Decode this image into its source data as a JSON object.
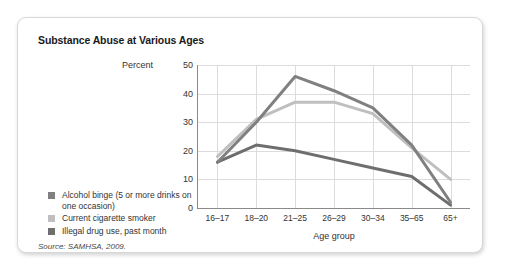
{
  "card": {
    "title": "Substance Abuse at Various Ages",
    "source_note": "Source: SAMHSA, 2009."
  },
  "colors": {
    "alcohol_binge": "#808080",
    "cigarette_smoker": "#bfbfbf",
    "illegal_drug": "#6e6e6e",
    "axis": "#8a8a8a",
    "grid": "#dcdcdc",
    "card_border": "#d8d8d8",
    "text": "#333333"
  },
  "legend": {
    "items": [
      {
        "label": "Alcohol binge (5 or more drinks on one occasion)",
        "color": "#808080"
      },
      {
        "label": "Current cigarette smoker",
        "color": "#bfbfbf"
      },
      {
        "label": "Illegal drug use, past month",
        "color": "#6e6e6e"
      }
    ]
  },
  "chart_data": {
    "type": "line",
    "title": "Substance Abuse at Various Ages",
    "subtitle": "",
    "xlabel": "Age group",
    "ylabel": "Percent",
    "categories": [
      "16–17",
      "18–20",
      "21–25",
      "26–29",
      "30–34",
      "35–65",
      "65+"
    ],
    "yticks": [
      0,
      10,
      20,
      30,
      40,
      50
    ],
    "ylim": [
      0,
      50
    ],
    "grid": true,
    "legend_position": "bottom-left-outside",
    "series": [
      {
        "name": "Alcohol binge (5 or more drinks on one occasion)",
        "color": "#808080",
        "values": [
          16,
          30,
          46,
          41,
          35,
          22,
          2
        ]
      },
      {
        "name": "Current cigarette smoker",
        "color": "#bfbfbf",
        "values": [
          18,
          31,
          37,
          37,
          33,
          21,
          10
        ]
      },
      {
        "name": "Illegal drug use, past month",
        "color": "#6e6e6e",
        "values": [
          16,
          22,
          20,
          17,
          14,
          11,
          1
        ]
      }
    ]
  }
}
